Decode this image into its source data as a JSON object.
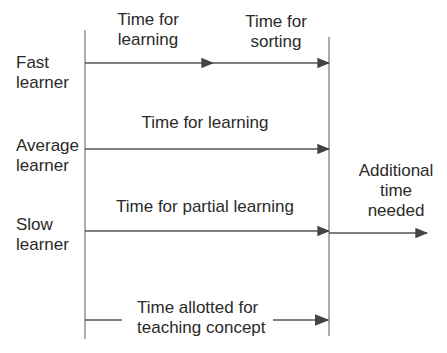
{
  "diagram": {
    "learners": [
      {
        "label_line1": "Fast",
        "label_line2": "learner"
      },
      {
        "label_line1": "Average",
        "label_line2": "learner"
      },
      {
        "label_line1": "Slow",
        "label_line2": "learner"
      }
    ],
    "segments": {
      "fast_learning_line1": "Time for",
      "fast_learning_line2": "learning",
      "fast_sorting_line1": "Time for",
      "fast_sorting_line2": "sorting",
      "average_learning": "Time for learning",
      "slow_partial": "Time for partial learning",
      "additional_line1": "Additional",
      "additional_line2": "time",
      "additional_line3": "needed"
    },
    "allotted": {
      "line1": "Time allotted for",
      "line2": "teaching concept"
    },
    "colors": {
      "line": "#555555",
      "arrow": "#444444",
      "text": "#2a2a2a"
    }
  }
}
